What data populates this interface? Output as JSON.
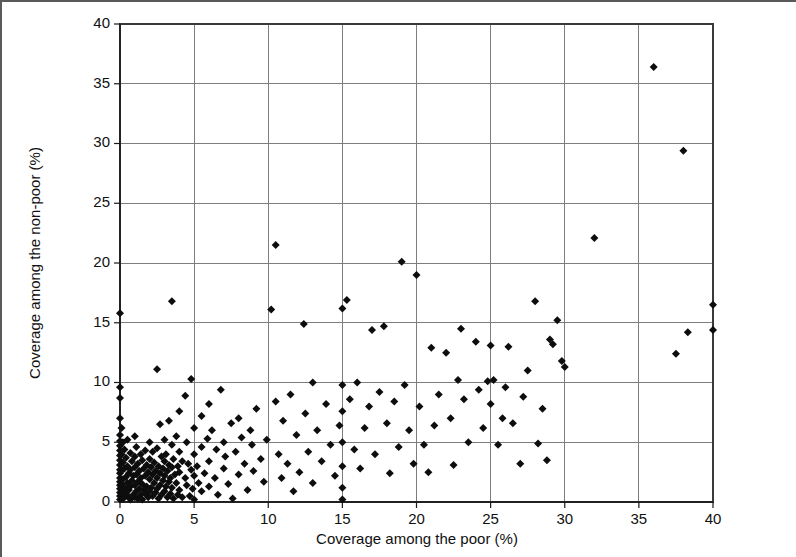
{
  "chart_data": {
    "type": "scatter",
    "title": "",
    "xlabel": "Coverage among the poor (%)",
    "ylabel": "Coverage among the non-poor (%)",
    "xlim": [
      0,
      40
    ],
    "ylim": [
      0,
      40
    ],
    "xticks": [
      0,
      5,
      10,
      15,
      20,
      25,
      30,
      35,
      40
    ],
    "yticks": [
      0,
      5,
      10,
      15,
      20,
      25,
      30,
      35,
      40
    ],
    "grid": true,
    "legend": "none",
    "marker": "diamond",
    "marker_color": "#0d0d0d",
    "point_count": 268,
    "points": [
      [
        0.0,
        15.8
      ],
      [
        0.0,
        9.6
      ],
      [
        0.0,
        8.7
      ],
      [
        0.0,
        7.0
      ],
      [
        0.0,
        5.6
      ],
      [
        0.0,
        5.1
      ],
      [
        0.0,
        4.7
      ],
      [
        0.0,
        4.3
      ],
      [
        0.0,
        3.9
      ],
      [
        0.0,
        3.5
      ],
      [
        0.0,
        3.1
      ],
      [
        0.0,
        2.7
      ],
      [
        0.0,
        2.4
      ],
      [
        0.0,
        2.0
      ],
      [
        0.0,
        1.7
      ],
      [
        0.0,
        1.4
      ],
      [
        0.0,
        1.1
      ],
      [
        0.0,
        0.8
      ],
      [
        0.0,
        0.5
      ],
      [
        0.0,
        0.2
      ],
      [
        0.1,
        6.2
      ],
      [
        0.1,
        4.0
      ],
      [
        0.1,
        2.6
      ],
      [
        0.1,
        1.5
      ],
      [
        0.2,
        5.0
      ],
      [
        0.2,
        3.3
      ],
      [
        0.2,
        1.9
      ],
      [
        0.2,
        0.9
      ],
      [
        0.2,
        0.3
      ],
      [
        0.3,
        4.4
      ],
      [
        0.3,
        2.8
      ],
      [
        0.3,
        1.2
      ],
      [
        0.3,
        0.4
      ],
      [
        0.4,
        3.7
      ],
      [
        0.4,
        2.1
      ],
      [
        0.4,
        0.7
      ],
      [
        0.5,
        5.2
      ],
      [
        0.5,
        3.0
      ],
      [
        0.5,
        1.6
      ],
      [
        0.5,
        0.5
      ],
      [
        0.6,
        2.4
      ],
      [
        0.6,
        1.0
      ],
      [
        0.7,
        4.1
      ],
      [
        0.7,
        2.7
      ],
      [
        0.7,
        1.3
      ],
      [
        0.7,
        0.2
      ],
      [
        0.8,
        3.4
      ],
      [
        0.8,
        1.8
      ],
      [
        0.9,
        2.2
      ],
      [
        0.9,
        0.6
      ],
      [
        1.0,
        5.5
      ],
      [
        1.0,
        3.8
      ],
      [
        1.0,
        2.9
      ],
      [
        1.0,
        1.4
      ],
      [
        1.0,
        0.4
      ],
      [
        1.1,
        4.6
      ],
      [
        1.1,
        2.3
      ],
      [
        1.1,
        0.9
      ],
      [
        1.2,
        3.2
      ],
      [
        1.2,
        1.7
      ],
      [
        1.2,
        0.3
      ],
      [
        1.3,
        2.6
      ],
      [
        1.3,
        1.1
      ],
      [
        1.4,
        4.0
      ],
      [
        1.4,
        2.0
      ],
      [
        1.4,
        0.6
      ],
      [
        1.5,
        3.5
      ],
      [
        1.5,
        1.5
      ],
      [
        1.5,
        0.2
      ],
      [
        1.6,
        2.8
      ],
      [
        1.6,
        1.0
      ],
      [
        1.7,
        4.3
      ],
      [
        1.7,
        2.2
      ],
      [
        1.7,
        0.7
      ],
      [
        1.8,
        3.1
      ],
      [
        1.8,
        1.3
      ],
      [
        1.9,
        2.5
      ],
      [
        1.9,
        0.4
      ],
      [
        2.0,
        5.0
      ],
      [
        2.0,
        3.6
      ],
      [
        2.0,
        1.9
      ],
      [
        2.0,
        0.9
      ],
      [
        2.1,
        2.9
      ],
      [
        2.1,
        1.2
      ],
      [
        2.2,
        4.2
      ],
      [
        2.2,
        2.3
      ],
      [
        2.2,
        0.5
      ],
      [
        2.3,
        3.3
      ],
      [
        2.3,
        1.6
      ],
      [
        2.4,
        2.6
      ],
      [
        2.4,
        0.8
      ],
      [
        2.5,
        11.1
      ],
      [
        2.5,
        4.5
      ],
      [
        2.5,
        2.0
      ],
      [
        2.5,
        1.1
      ],
      [
        2.6,
        3.0
      ],
      [
        2.6,
        0.3
      ],
      [
        2.7,
        6.5
      ],
      [
        2.7,
        2.4
      ],
      [
        2.7,
        1.4
      ],
      [
        2.8,
        3.8
      ],
      [
        2.8,
        0.6
      ],
      [
        2.9,
        2.8
      ],
      [
        2.9,
        1.8
      ],
      [
        3.0,
        5.2
      ],
      [
        3.0,
        3.4
      ],
      [
        3.0,
        2.2
      ],
      [
        3.0,
        0.9
      ],
      [
        3.1,
        4.0
      ],
      [
        3.1,
        1.3
      ],
      [
        3.2,
        2.6
      ],
      [
        3.2,
        0.4
      ],
      [
        3.3,
        6.8
      ],
      [
        3.3,
        3.1
      ],
      [
        3.3,
        1.7
      ],
      [
        3.4,
        2.0
      ],
      [
        3.4,
        0.7
      ],
      [
        3.5,
        16.8
      ],
      [
        3.5,
        4.8
      ],
      [
        3.5,
        2.9
      ],
      [
        3.5,
        1.2
      ],
      [
        3.6,
        3.6
      ],
      [
        3.6,
        0.3
      ],
      [
        3.7,
        2.3
      ],
      [
        3.8,
        5.5
      ],
      [
        3.8,
        1.6
      ],
      [
        3.9,
        3.0
      ],
      [
        3.9,
        0.6
      ],
      [
        4.0,
        7.6
      ],
      [
        4.0,
        4.2
      ],
      [
        4.0,
        2.5
      ],
      [
        4.0,
        1.0
      ],
      [
        4.2,
        3.4
      ],
      [
        4.2,
        0.4
      ],
      [
        4.4,
        8.9
      ],
      [
        4.4,
        2.0
      ],
      [
        4.5,
        5.0
      ],
      [
        4.5,
        1.4
      ],
      [
        4.6,
        3.2
      ],
      [
        4.7,
        0.5
      ],
      [
        4.8,
        10.3
      ],
      [
        4.8,
        2.7
      ],
      [
        4.9,
        1.1
      ],
      [
        5.0,
        6.2
      ],
      [
        5.0,
        4.0
      ],
      [
        5.0,
        2.2
      ],
      [
        5.0,
        0.2
      ],
      [
        5.2,
        3.0
      ],
      [
        5.3,
        1.6
      ],
      [
        5.5,
        7.2
      ],
      [
        5.5,
        4.6
      ],
      [
        5.5,
        0.9
      ],
      [
        5.7,
        2.4
      ],
      [
        5.9,
        5.3
      ],
      [
        6.0,
        8.2
      ],
      [
        6.0,
        3.4
      ],
      [
        6.0,
        1.3
      ],
      [
        6.2,
        6.0
      ],
      [
        6.4,
        2.0
      ],
      [
        6.5,
        4.4
      ],
      [
        6.6,
        0.6
      ],
      [
        6.8,
        9.4
      ],
      [
        7.0,
        5.0
      ],
      [
        7.0,
        2.8
      ],
      [
        7.1,
        3.8
      ],
      [
        7.3,
        1.5
      ],
      [
        7.5,
        6.6
      ],
      [
        7.6,
        0.3
      ],
      [
        7.8,
        4.2
      ],
      [
        8.0,
        7.0
      ],
      [
        8.0,
        2.3
      ],
      [
        8.2,
        5.4
      ],
      [
        8.4,
        3.2
      ],
      [
        8.6,
        1.0
      ],
      [
        8.8,
        6.0
      ],
      [
        8.9,
        4.8
      ],
      [
        9.0,
        2.6
      ],
      [
        9.2,
        7.8
      ],
      [
        9.5,
        3.6
      ],
      [
        9.7,
        1.7
      ],
      [
        9.9,
        5.2
      ],
      [
        10.2,
        16.1
      ],
      [
        10.5,
        21.5
      ],
      [
        10.5,
        8.4
      ],
      [
        10.7,
        4.0
      ],
      [
        10.9,
        2.0
      ],
      [
        11.0,
        6.8
      ],
      [
        11.3,
        3.2
      ],
      [
        11.5,
        9.0
      ],
      [
        11.7,
        0.9
      ],
      [
        11.9,
        5.6
      ],
      [
        12.1,
        2.5
      ],
      [
        12.4,
        14.9
      ],
      [
        12.5,
        7.4
      ],
      [
        12.7,
        4.2
      ],
      [
        13.0,
        10.0
      ],
      [
        13.0,
        1.6
      ],
      [
        13.3,
        6.0
      ],
      [
        13.6,
        3.4
      ],
      [
        13.9,
        8.2
      ],
      [
        14.2,
        4.8
      ],
      [
        14.5,
        2.2
      ],
      [
        14.8,
        6.4
      ],
      [
        15.0,
        16.2
      ],
      [
        15.0,
        9.8
      ],
      [
        15.0,
        7.6
      ],
      [
        15.0,
        5.0
      ],
      [
        15.0,
        3.0
      ],
      [
        15.0,
        1.2
      ],
      [
        15.0,
        0.2
      ],
      [
        15.3,
        16.9
      ],
      [
        15.5,
        8.6
      ],
      [
        15.8,
        4.4
      ],
      [
        16.0,
        10.0
      ],
      [
        16.2,
        2.8
      ],
      [
        16.5,
        6.2
      ],
      [
        16.8,
        8.0
      ],
      [
        17.0,
        14.4
      ],
      [
        17.2,
        4.0
      ],
      [
        17.5,
        9.2
      ],
      [
        17.8,
        14.7
      ],
      [
        18.0,
        6.6
      ],
      [
        18.2,
        2.4
      ],
      [
        18.5,
        8.4
      ],
      [
        18.8,
        4.6
      ],
      [
        19.0,
        20.1
      ],
      [
        19.2,
        9.8
      ],
      [
        19.5,
        6.0
      ],
      [
        19.8,
        3.2
      ],
      [
        20.0,
        19.0
      ],
      [
        20.2,
        8.0
      ],
      [
        20.5,
        4.8
      ],
      [
        20.8,
        2.5
      ],
      [
        21.0,
        12.9
      ],
      [
        21.2,
        6.4
      ],
      [
        21.5,
        9.0
      ],
      [
        22.0,
        12.5
      ],
      [
        22.3,
        7.0
      ],
      [
        22.5,
        3.1
      ],
      [
        22.8,
        10.2
      ],
      [
        23.0,
        14.5
      ],
      [
        23.2,
        8.6
      ],
      [
        23.5,
        5.0
      ],
      [
        24.0,
        13.4
      ],
      [
        24.2,
        9.4
      ],
      [
        24.5,
        6.2
      ],
      [
        24.8,
        10.1
      ],
      [
        25.0,
        13.1
      ],
      [
        25.0,
        8.2
      ],
      [
        25.2,
        10.2
      ],
      [
        25.5,
        4.8
      ],
      [
        25.8,
        7.0
      ],
      [
        26.0,
        9.6
      ],
      [
        26.2,
        13.0
      ],
      [
        26.5,
        6.6
      ],
      [
        27.0,
        3.2
      ],
      [
        27.2,
        8.8
      ],
      [
        27.5,
        11.0
      ],
      [
        28.0,
        16.8
      ],
      [
        28.2,
        4.9
      ],
      [
        28.5,
        7.8
      ],
      [
        28.8,
        3.5
      ],
      [
        29.0,
        13.6
      ],
      [
        29.2,
        13.2
      ],
      [
        29.5,
        15.2
      ],
      [
        29.8,
        11.8
      ],
      [
        30.0,
        11.3
      ],
      [
        32.0,
        22.1
      ],
      [
        36.0,
        36.4
      ],
      [
        37.5,
        12.4
      ],
      [
        38.0,
        29.4
      ],
      [
        38.3,
        14.2
      ],
      [
        40.0,
        16.5
      ],
      [
        40.0,
        14.4
      ]
    ]
  },
  "figure": {
    "border_color": "#5a5a5a",
    "background": "#ffffff",
    "grid_color": "#7d7d7d",
    "axis_color": "#1a1a1a"
  }
}
